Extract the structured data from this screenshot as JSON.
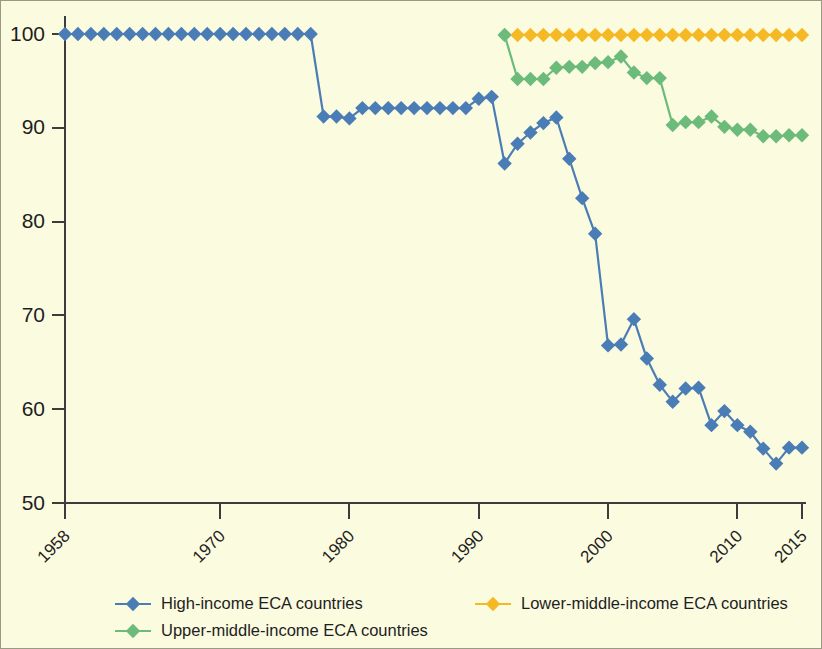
{
  "figure": {
    "background_color": "#fbfbe0",
    "border_color": "#9a9a84",
    "axis_color": "#3c3c3c"
  },
  "chart_data": {
    "type": "line",
    "title": "",
    "subtitle": "",
    "xlabel": "",
    "ylabel": "",
    "xlim": [
      1958,
      2015
    ],
    "ylim": [
      50,
      100
    ],
    "grid": false,
    "legend_position": "bottom",
    "xticks": [
      1958,
      1970,
      1980,
      1990,
      2000,
      2010,
      2015
    ],
    "xtick_labels": [
      "1958",
      "1970",
      "1980",
      "1990",
      "2000",
      "2010",
      "2015"
    ],
    "yticks": [
      50,
      60,
      70,
      80,
      90,
      100
    ],
    "ytick_labels": [
      "50",
      "60",
      "70",
      "80",
      "90",
      "100"
    ],
    "marker": "diamond",
    "series": [
      {
        "name": "High-income ECA countries",
        "color": "#4a7db5",
        "x": [
          1958,
          1959,
          1960,
          1961,
          1962,
          1963,
          1964,
          1965,
          1966,
          1967,
          1968,
          1969,
          1970,
          1971,
          1972,
          1973,
          1974,
          1975,
          1976,
          1977,
          1978,
          1979,
          1980,
          1981,
          1982,
          1983,
          1984,
          1985,
          1986,
          1987,
          1988,
          1989,
          1990,
          1991,
          1992,
          1993,
          1994,
          1995,
          1996,
          1997,
          1998,
          1999,
          2000,
          2001,
          2002,
          2003,
          2004,
          2005,
          2006,
          2007,
          2008,
          2009,
          2010,
          2011,
          2012,
          2013,
          2014,
          2015
        ],
        "values": [
          100,
          100,
          100,
          100,
          100,
          100,
          100,
          100,
          100,
          100,
          100,
          100,
          100,
          100,
          100,
          100,
          100,
          100,
          100,
          100,
          91.2,
          91.2,
          91.0,
          92.1,
          92.1,
          92.1,
          92.1,
          92.1,
          92.1,
          92.1,
          92.1,
          92.1,
          93.1,
          93.3,
          86.2,
          88.3,
          89.5,
          90.5,
          91.1,
          86.7,
          82.5,
          78.7,
          66.8,
          66.9,
          69.6,
          65.4,
          62.6,
          60.8,
          62.2,
          62.3,
          58.3,
          59.8,
          58.3,
          57.6,
          55.8,
          54.2,
          55.9,
          55.9
        ]
      },
      {
        "name": "Upper-middle-income ECA countries",
        "color": "#6cbb7b",
        "x": [
          1992,
          1993,
          1994,
          1995,
          1996,
          1997,
          1998,
          1999,
          2000,
          2001,
          2002,
          2003,
          2004,
          2005,
          2006,
          2007,
          2008,
          2009,
          2010,
          2011,
          2012,
          2013,
          2014,
          2015
        ],
        "values": [
          99.9,
          95.2,
          95.2,
          95.2,
          96.4,
          96.5,
          96.5,
          96.9,
          97.0,
          97.6,
          95.9,
          95.3,
          95.3,
          90.3,
          90.6,
          90.6,
          91.2,
          90.1,
          89.8,
          89.8,
          89.1,
          89.1,
          89.2,
          89.2
        ]
      },
      {
        "name": "Lower-middle-income ECA countries",
        "color": "#f6b926",
        "x": [
          1993,
          1994,
          1995,
          1996,
          1997,
          1998,
          1999,
          2000,
          2001,
          2002,
          2003,
          2004,
          2005,
          2006,
          2007,
          2008,
          2009,
          2010,
          2011,
          2012,
          2013,
          2014,
          2015
        ],
        "values": [
          99.9,
          99.9,
          99.9,
          99.9,
          99.9,
          99.9,
          99.9,
          99.9,
          99.9,
          99.9,
          99.9,
          99.9,
          99.9,
          99.9,
          99.9,
          99.9,
          99.9,
          99.9,
          99.9,
          99.9,
          99.9,
          99.9,
          99.9
        ]
      }
    ],
    "legend": [
      {
        "label": "High-income ECA countries",
        "color": "#4a7db5"
      },
      {
        "label": "Lower-middle-income ECA countries",
        "color": "#f6b926"
      },
      {
        "label": "Upper-middle-income ECA countries",
        "color": "#6cbb7b"
      }
    ]
  }
}
